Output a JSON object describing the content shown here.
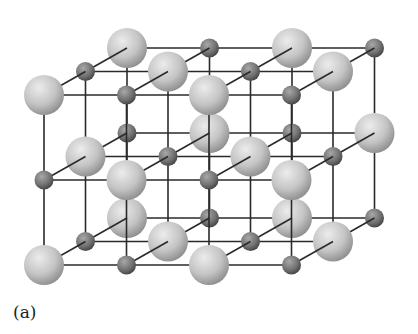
{
  "figure": {
    "caption": "(a)",
    "grid": {
      "nx": 4,
      "ny": 3,
      "nz": 3
    },
    "origin": [
      44,
      95
    ],
    "step_x": 82.5,
    "step_y": 85,
    "depth_offset": [
      41.5,
      -23.5
    ],
    "large_radius": 20,
    "small_radius": 9.5,
    "colors": {
      "bond": "#2a2a2a",
      "large_light": "#e2e2e2",
      "large_dark": "#9a9a9a",
      "small_light": "#9c9c9c",
      "small_dark": "#505050"
    },
    "ion_types": [
      "large-ion",
      "small-ion"
    ]
  }
}
